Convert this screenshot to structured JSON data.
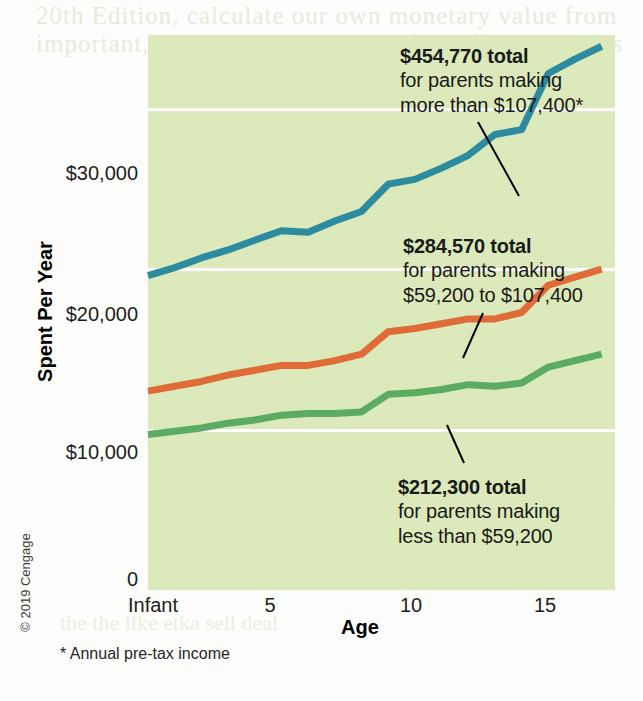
{
  "figure": {
    "copyright": "© 2019 Cengage",
    "footnote": "* Annual pre-tax income",
    "bleed_text_top_1": "20th Edition, calculate our own monetary value from",
    "bleed_text_top_2": "important, but our tax payments often affect our lives",
    "bleed_text_bottom": "the the  like  etka  sell  deal"
  },
  "chart_data": {
    "type": "line",
    "title": "",
    "xlabel": "Age",
    "ylabel": "Spent Per Year",
    "xlim": [
      0,
      17.5
    ],
    "ylim": [
      0,
      34600
    ],
    "grid": true,
    "legend_position": "annotations-on-plot",
    "x_tick_labels": [
      "Infant",
      "5",
      "10",
      "15"
    ],
    "x_tick_values": [
      0,
      5,
      10,
      15
    ],
    "y_tick_labels": [
      "0",
      "$10,000",
      "$20,000",
      "$30,000"
    ],
    "y_tick_values": [
      0,
      10000,
      20000,
      30000
    ],
    "x": [
      0,
      1,
      2,
      3,
      4,
      5,
      6,
      7,
      8,
      9,
      10,
      11,
      12,
      13,
      14,
      15,
      16,
      17
    ],
    "series": [
      {
        "name": "Parents making more than $107,400",
        "color": "#2d8ba0",
        "total": 454770,
        "values": [
          19600,
          20100,
          20700,
          21200,
          21800,
          22400,
          22300,
          23000,
          23600,
          25300,
          25600,
          26300,
          27100,
          28400,
          28700,
          32200,
          33100,
          33900
        ]
      },
      {
        "name": "Parents making $59,200 to $107,400",
        "color": "#df6b38",
        "total": 284570,
        "values": [
          12400,
          12700,
          13000,
          13400,
          13700,
          14000,
          14000,
          14300,
          14700,
          16100,
          16300,
          16600,
          16900,
          16900,
          17300,
          19000,
          19500,
          20000
        ]
      },
      {
        "name": "Parents making less than $59,200",
        "color": "#5cab62",
        "total": 212300,
        "values": [
          9700,
          9900,
          10100,
          10400,
          10600,
          10900,
          11000,
          11000,
          11100,
          12200,
          12300,
          12500,
          12800,
          12700,
          12900,
          13900,
          14300,
          14700
        ]
      }
    ],
    "annotations": [
      {
        "id": "high",
        "headline": "$454,770 total",
        "line2": "for parents making",
        "line3": "more than $107,400*"
      },
      {
        "id": "mid",
        "headline": "$284,570 total",
        "line2": "for parents making",
        "line3": "$59,200 to $107,400"
      },
      {
        "id": "low",
        "headline": "$212,300 total",
        "line2": "for parents making",
        "line3": "less than $59,200"
      }
    ]
  }
}
